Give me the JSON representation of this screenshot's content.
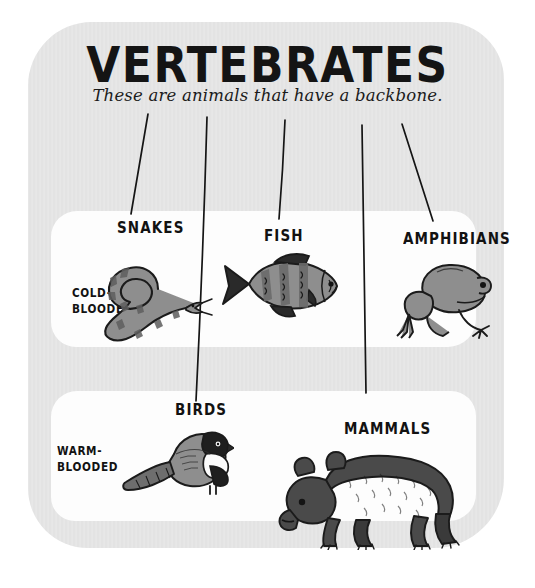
{
  "poster": {
    "title": "VERTEBRATES",
    "subtitle": "These are animals that have a backbone.",
    "background_color": "#e3e3e3",
    "card_color": "#fdfdfd",
    "ink_color": "#141414"
  },
  "rows": [
    {
      "id": "cold-blooded",
      "label_line1": "COLD-",
      "label_line2": "BLOODED",
      "categories": [
        {
          "id": "snakes",
          "label": "SNAKES",
          "illustration": "snake-illustration"
        },
        {
          "id": "fish",
          "label": "FISH",
          "illustration": "fish-illustration"
        },
        {
          "id": "amphibians",
          "label": "AMPHIBIANS",
          "illustration": "frog-illustration"
        }
      ]
    },
    {
      "id": "warm-blooded",
      "label_line1": "WARM-",
      "label_line2": "BLOODED",
      "categories": [
        {
          "id": "birds",
          "label": "BIRDS",
          "illustration": "bird-illustration"
        },
        {
          "id": "mammals",
          "label": "MAMMALS",
          "illustration": "bear-illustration"
        }
      ]
    }
  ],
  "connectors": [
    {
      "id": "connector-snakes",
      "x1": 148,
      "y1": 114,
      "x2": 131,
      "y2": 214
    },
    {
      "id": "connector-fish",
      "x1": 207,
      "y1": 117,
      "x2": 196,
      "y2": 401
    },
    {
      "id": "connector-amphibians",
      "x1": 285,
      "y1": 120,
      "x2": 279,
      "y2": 219
    },
    {
      "id": "connector-birds",
      "x1": 362,
      "y1": 125,
      "x2": 366,
      "y2": 393
    },
    {
      "id": "connector-mammals",
      "x1": 402,
      "y1": 124,
      "x2": 433,
      "y2": 221
    }
  ]
}
